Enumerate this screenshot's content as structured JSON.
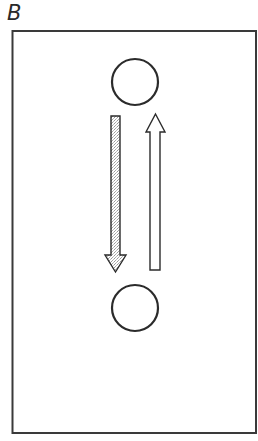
{
  "panel": {
    "label": "B"
  },
  "frame": {
    "x": 12,
    "y": 31,
    "width": 244,
    "height": 402,
    "stroke": "#3a3a3a"
  },
  "nodes": [
    {
      "id": "top-circle",
      "shape": "circle",
      "cx": 135,
      "cy": 82,
      "r": 23
    },
    {
      "id": "bottom-circle",
      "shape": "circle",
      "cx": 135,
      "cy": 308,
      "r": 23
    }
  ],
  "arrows": [
    {
      "id": "down-arrow",
      "direction": "down",
      "fill": "stippled-grey",
      "from": "top-circle",
      "to": "bottom-circle"
    },
    {
      "id": "up-arrow",
      "direction": "up",
      "fill": "white",
      "from": "bottom-circle",
      "to": "top-circle"
    }
  ],
  "colors": {
    "stroke": "#2b2b2b",
    "stipple": "#c8c8c8",
    "background": "#ffffff"
  }
}
